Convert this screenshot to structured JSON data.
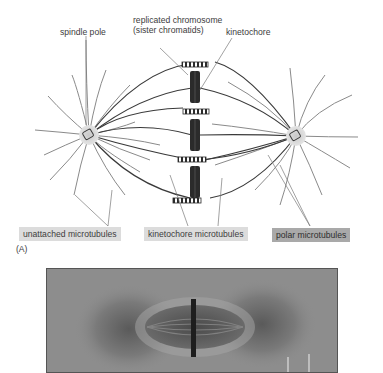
{
  "figure": {
    "panel_label": "(A)",
    "labels": {
      "spindle_pole": "spindle pole",
      "replicated_chromosome": "replicated chromosome (sister chromatids)",
      "kinetochore": "kinetochore"
    },
    "legend_boxes": [
      {
        "text": "unattached microtubules",
        "shade": "light",
        "color": "#dcdcdc"
      },
      {
        "text": "kinetochore microtubules",
        "shade": "light",
        "color": "#dcdcdc"
      },
      {
        "text": "polar microtubules",
        "shade": "dark",
        "color": "#a9a9a9"
      }
    ],
    "colors": {
      "background": "#ffffff",
      "microtubule_light": "#8a8a8a",
      "microtubule_dark": "#3a3a3a",
      "chromosome": "#2b2b2b",
      "pole_halo": "#cfcfcf",
      "micrograph_bg": "#8d8d8d"
    },
    "structure": {
      "spindle_pole_count": 2,
      "chromosome_count": 3,
      "kinetochore_bars": 6
    },
    "micrograph": {
      "description": "light micrograph of mitotic spindle at metaphase"
    }
  }
}
